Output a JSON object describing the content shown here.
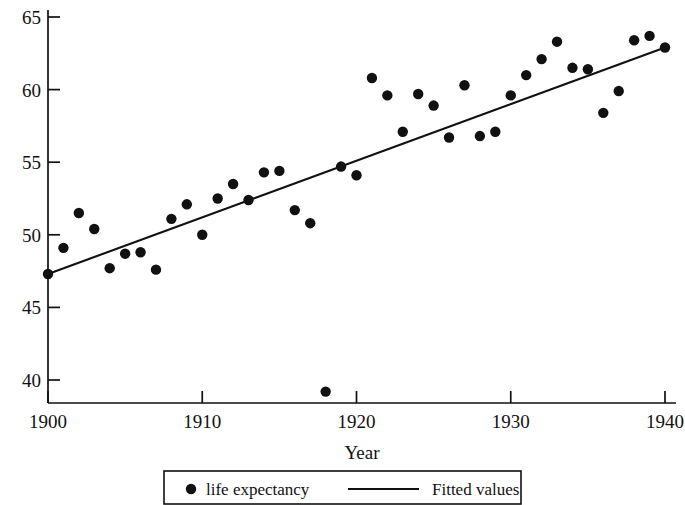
{
  "chart_data": {
    "type": "scatter",
    "title": "",
    "xlabel": "Year",
    "ylabel": "",
    "xlim": [
      1900,
      1940
    ],
    "ylim": [
      38.3,
      65.5
    ],
    "xticks": [
      1900,
      1910,
      1920,
      1930,
      1940
    ],
    "yticks": [
      40,
      45,
      50,
      55,
      60,
      65
    ],
    "xtick_labels": [
      "1900",
      "1910",
      "1920",
      "1930",
      "1940"
    ],
    "ytick_labels": [
      "40",
      "45",
      "50",
      "55",
      "60",
      "65"
    ],
    "grid": false,
    "legend_position": "below-axes",
    "marker_color": "#111111",
    "line_color": "#111111",
    "series": [
      {
        "name": "life expectancy",
        "type": "scatter",
        "x": [
          1900,
          1901,
          1902,
          1903,
          1904,
          1905,
          1906,
          1907,
          1908,
          1909,
          1910,
          1911,
          1912,
          1913,
          1914,
          1915,
          1916,
          1917,
          1918,
          1919,
          1920,
          1921,
          1922,
          1923,
          1924,
          1925,
          1926,
          1927,
          1928,
          1929,
          1930,
          1931,
          1932,
          1933,
          1934,
          1935,
          1936,
          1937,
          1938,
          1939,
          1940
        ],
        "values": [
          47.3,
          49.1,
          51.5,
          50.4,
          47.7,
          48.7,
          48.8,
          47.6,
          51.1,
          52.1,
          50.0,
          52.5,
          53.5,
          52.4,
          54.3,
          54.4,
          51.7,
          50.8,
          39.2,
          54.7,
          54.1,
          60.8,
          59.6,
          57.1,
          59.7,
          58.9,
          56.7,
          60.3,
          56.8,
          57.1,
          59.6,
          61.0,
          62.1,
          63.3,
          61.5,
          61.4,
          58.4,
          59.9,
          63.4,
          63.7,
          62.9
        ]
      },
      {
        "name": "Fitted values",
        "type": "line",
        "x": [
          1900,
          1940
        ],
        "values": [
          47.3,
          62.9
        ]
      }
    ]
  },
  "legend": {
    "items": [
      {
        "label": "life expectancy",
        "marker": "dot"
      },
      {
        "label": "Fitted values",
        "marker": "line"
      }
    ]
  },
  "axis": {
    "x_title": "Year"
  }
}
